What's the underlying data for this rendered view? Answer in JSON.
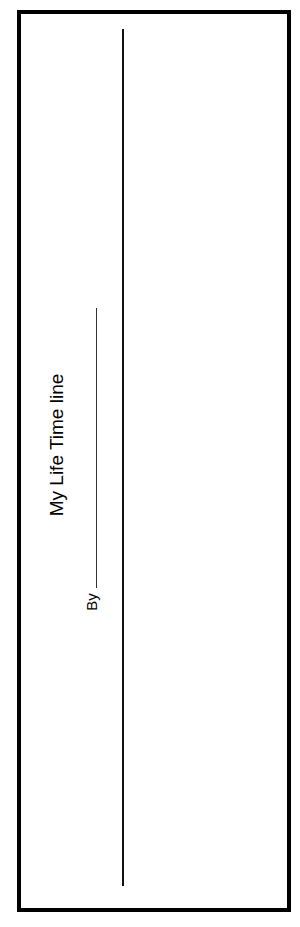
{
  "document": {
    "title": "My Life Time line",
    "by_label": "By",
    "border_color": "#000000",
    "line_color": "#111111"
  }
}
